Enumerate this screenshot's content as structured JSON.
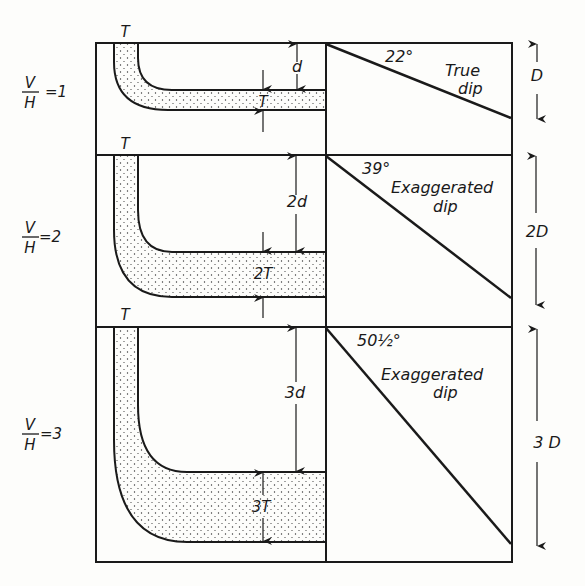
{
  "figure": {
    "ink_color": "#1a1a1a",
    "background": "#fdfdfb",
    "panels": [
      {
        "ratio_label": {
          "num": "V",
          "den": "H",
          "value": "=1"
        },
        "top_label": "T",
        "depth_label": "d",
        "thickness_label": "T",
        "angle_label": "22°",
        "dip_label_line1": "True",
        "dip_label_line2": "dip",
        "height_label": "D"
      },
      {
        "ratio_label": {
          "num": "V",
          "den": "H",
          "value": "=2"
        },
        "top_label": "T",
        "depth_label": "2d",
        "thickness_label": "2T",
        "angle_label": "39°",
        "dip_label_line1": "Exaggerated",
        "dip_label_line2": "dip",
        "height_label": "2D"
      },
      {
        "ratio_label": {
          "num": "V",
          "den": "H",
          "value": "=3"
        },
        "top_label": "T",
        "depth_label": "3d",
        "thickness_label": "3T",
        "angle_label": "50½°",
        "dip_label_line1": "Exaggerated",
        "dip_label_line2": "dip",
        "height_label": "3 D"
      }
    ]
  }
}
